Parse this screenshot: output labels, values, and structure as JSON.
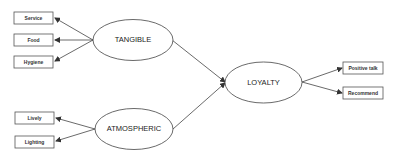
{
  "diagram": {
    "constructs": {
      "tangible": "TANGIBLE",
      "atmospheric": "ATMOSPHERIC",
      "loyalty": "LOYALTY"
    },
    "indicators": {
      "service": "Service",
      "food": "Food",
      "hygiene": "Hygiene",
      "lively": "Lively",
      "lighting": "Lighting",
      "positive_talk": "Positive talk",
      "recommend": "Recommend"
    },
    "colors": {
      "stroke": "#444444",
      "background": "#ffffff"
    }
  }
}
